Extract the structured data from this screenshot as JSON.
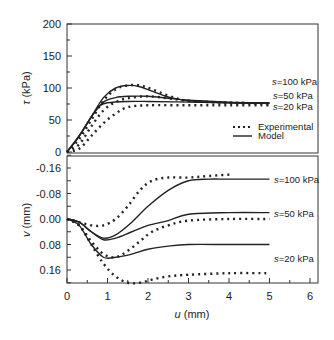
{
  "chart_data": [
    {
      "type": "line",
      "panel": "upper",
      "title": "",
      "xlabel": "u (mm)",
      "ylabel": "τ (kPa)",
      "xlim": [
        0,
        6.2
      ],
      "ylim": [
        0,
        200
      ],
      "yticks": [
        "0",
        "50",
        "100",
        "150",
        "200"
      ],
      "grid": false,
      "legend": {
        "position": "lower right",
        "entries": [
          "Experimental",
          "Model"
        ]
      },
      "annotations": [
        "s=100 kPa",
        "s=50 kPa",
        "s=20 kPa"
      ],
      "series": [
        {
          "name": "Model s=100 kPa",
          "style": "solid",
          "x": [
            0,
            0.3,
            0.6,
            0.9,
            1.2,
            1.5,
            1.8,
            2.1,
            2.5,
            3,
            4,
            5
          ],
          "y": [
            0,
            25,
            55,
            85,
            100,
            104,
            102,
            95,
            86,
            80,
            77,
            76
          ]
        },
        {
          "name": "Model s=50 kPa",
          "style": "solid",
          "x": [
            0,
            0.3,
            0.6,
            0.9,
            1.2,
            1.5,
            2,
            2.5,
            3,
            4,
            5
          ],
          "y": [
            0,
            25,
            55,
            78,
            85,
            87,
            87,
            84,
            81,
            78,
            77
          ]
        },
        {
          "name": "Model s=20 kPa",
          "style": "solid",
          "x": [
            0,
            0.3,
            0.6,
            0.8,
            1,
            1.5,
            2,
            3,
            4,
            5
          ],
          "y": [
            0,
            25,
            55,
            72,
            77,
            79,
            79,
            78,
            77,
            76
          ]
        },
        {
          "name": "Experimental s=100 kPa",
          "style": "dotted",
          "x": [
            0,
            0.3,
            0.6,
            0.9,
            1.2,
            1.5,
            1.8,
            2.1,
            2.5,
            3,
            4,
            5
          ],
          "y": [
            0,
            20,
            50,
            80,
            98,
            104,
            104,
            98,
            88,
            80,
            77,
            76
          ]
        },
        {
          "name": "Experimental s=50 kPa",
          "style": "dotted",
          "x": [
            0,
            0.3,
            0.6,
            0.9,
            1.2,
            1.5,
            2,
            2.5,
            3,
            4,
            5
          ],
          "y": [
            0,
            12,
            40,
            65,
            78,
            84,
            87,
            84,
            80,
            77,
            76
          ]
        },
        {
          "name": "Experimental s=20 kPa",
          "style": "dotted",
          "x": [
            0,
            0.3,
            0.6,
            0.9,
            1.2,
            1.5,
            2,
            3,
            4,
            5
          ],
          "y": [
            0,
            5,
            25,
            45,
            60,
            70,
            73,
            73,
            73,
            73
          ]
        }
      ]
    },
    {
      "type": "line",
      "panel": "lower",
      "title": "",
      "xlabel": "u (mm)",
      "ylabel": "v (mm)",
      "xlim": [
        0,
        6.2
      ],
      "ylim": [
        -0.2,
        0.2
      ],
      "yaxis_inverted": true,
      "xticks": [
        "0",
        "1",
        "2",
        "3",
        "4",
        "5",
        "6"
      ],
      "yticks": [
        "-0.16",
        "-0.08",
        "0.00",
        "0.08",
        "0.16"
      ],
      "grid": false,
      "annotations": [
        "s=100 kPa",
        "s=50 kPa",
        "s=20 kPa"
      ],
      "series": [
        {
          "name": "Model s=100 kPa",
          "style": "solid",
          "x": [
            0,
            0.3,
            0.6,
            0.9,
            1.2,
            1.6,
            2,
            2.5,
            3,
            3.5,
            4,
            5
          ],
          "y": [
            0,
            0.01,
            0.04,
            0.06,
            0.05,
            0.01,
            -0.04,
            -0.09,
            -0.12,
            -0.125,
            -0.125,
            -0.125
          ]
        },
        {
          "name": "Model s=50 kPa",
          "style": "solid",
          "x": [
            0,
            0.3,
            0.6,
            0.9,
            1.2,
            1.6,
            2,
            2.5,
            3,
            4,
            5
          ],
          "y": [
            0,
            0.01,
            0.04,
            0.065,
            0.06,
            0.04,
            0.02,
            0.005,
            -0.015,
            -0.02,
            -0.02
          ]
        },
        {
          "name": "Model s=20 kPa",
          "style": "solid",
          "x": [
            0,
            0.3,
            0.6,
            0.9,
            1.2,
            1.6,
            2,
            2.5,
            3,
            4,
            5
          ],
          "y": [
            0,
            0.02,
            0.08,
            0.12,
            0.12,
            0.11,
            0.095,
            0.085,
            0.08,
            0.08,
            0.08
          ]
        },
        {
          "name": "Experimental s=100 kPa",
          "style": "dotted",
          "x": [
            0,
            0.3,
            0.6,
            0.9,
            1.2,
            1.5,
            1.8,
            2.1,
            2.5,
            3,
            3.5,
            4.1
          ],
          "y": [
            0,
            0.01,
            0.02,
            0.02,
            0.0,
            -0.04,
            -0.09,
            -0.12,
            -0.13,
            -0.13,
            -0.135,
            -0.14
          ]
        },
        {
          "name": "Experimental s=50 kPa",
          "style": "dotted",
          "x": [
            0,
            0.3,
            0.6,
            0.9,
            1.2,
            1.5,
            1.8,
            2.1,
            2.5,
            3,
            4,
            5
          ],
          "y": [
            0,
            0.02,
            0.07,
            0.11,
            0.12,
            0.1,
            0.07,
            0.04,
            0.02,
            0.005,
            0.0,
            0.0
          ]
        },
        {
          "name": "Experimental s=20 kPa",
          "style": "dotted",
          "x": [
            0,
            0.3,
            0.6,
            0.9,
            1.2,
            1.5,
            1.8,
            2.1,
            2.5,
            3,
            4,
            5
          ],
          "y": [
            0,
            0.02,
            0.08,
            0.14,
            0.18,
            0.2,
            0.2,
            0.19,
            0.18,
            0.175,
            0.17,
            0.17
          ]
        }
      ]
    }
  ],
  "labels": {
    "upper_ylabel_sym": "τ",
    "upper_ylabel_unit": " (kPa)",
    "lower_ylabel_sym": "v",
    "lower_ylabel_unit": " (mm)",
    "xlabel_sym": "u",
    "xlabel_unit": " (mm)",
    "s100": "=100 kPa",
    "s50": "=50 kPa",
    "s20": "=20 kPa",
    "s_sym": "s",
    "legend_exp": "Experimental",
    "legend_model": "Model"
  }
}
